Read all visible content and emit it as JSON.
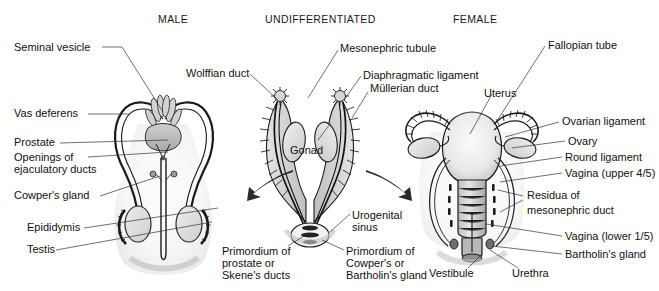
{
  "figure": {
    "background_color": "#ffffff",
    "ink_color": "#111111",
    "leader_color": "#333333",
    "width": 659,
    "height": 291
  },
  "headers": [
    {
      "id": "male",
      "text": "MALE"
    },
    {
      "id": "undifferentiated",
      "text": "UNDIFFERENTIATED"
    },
    {
      "id": "female",
      "text": "FEMALE"
    }
  ],
  "panels": {
    "male": {
      "header": "MALE",
      "labels": [
        {
          "id": "seminal-vesicle",
          "text": "Seminal vesicle"
        },
        {
          "id": "vas-deferens",
          "text": "Vas deferens"
        },
        {
          "id": "prostate",
          "text": "Prostate"
        },
        {
          "id": "openings-ejaculatory-ducts-l1",
          "text": "Openings of"
        },
        {
          "id": "openings-ejaculatory-ducts-l2",
          "text": "ejaculatory ducts"
        },
        {
          "id": "cowpers-gland",
          "text": "Cowper's gland"
        },
        {
          "id": "epididymis",
          "text": "Epididymis"
        },
        {
          "id": "testis",
          "text": "Testis"
        }
      ]
    },
    "undifferentiated": {
      "header": "UNDIFFERENTIATED",
      "labels": [
        {
          "id": "wolffian-duct",
          "text": "Wolffian duct"
        },
        {
          "id": "mesonephric-tubule",
          "text": "Mesonephric tubule"
        },
        {
          "id": "diaphragmatic-ligament",
          "text": "Diaphragmatic ligament"
        },
        {
          "id": "mullerian-duct",
          "text": "Müllerian duct"
        },
        {
          "id": "gonad",
          "text": "Gonad"
        },
        {
          "id": "urogenital-sinus-l1",
          "text": "Urogenital"
        },
        {
          "id": "urogenital-sinus-l2",
          "text": "sinus"
        },
        {
          "id": "primordium-prostate-l1",
          "text": "Primordium of"
        },
        {
          "id": "primordium-prostate-l2",
          "text": "prostate or"
        },
        {
          "id": "primordium-prostate-l3",
          "text": "Skene's ducts"
        },
        {
          "id": "primordium-cowpers-l1",
          "text": "Primordium of"
        },
        {
          "id": "primordium-cowpers-l2",
          "text": "Cowper's or"
        },
        {
          "id": "primordium-cowpers-l3",
          "text": "Bartholin's gland"
        }
      ]
    },
    "female": {
      "header": "FEMALE",
      "labels": [
        {
          "id": "fallopian-tube",
          "text": "Fallopian tube"
        },
        {
          "id": "uterus",
          "text": "Uterus"
        },
        {
          "id": "ovarian-ligament",
          "text": "Ovarian ligament"
        },
        {
          "id": "ovary",
          "text": "Ovary"
        },
        {
          "id": "round-ligament",
          "text": "Round ligament"
        },
        {
          "id": "vagina-upper",
          "text": "Vagina (upper 4/5)"
        },
        {
          "id": "residua-mesonephric-l1",
          "text": "Residua of"
        },
        {
          "id": "residua-mesonephric-l2",
          "text": "mesonephric duct"
        },
        {
          "id": "vagina-lower",
          "text": "Vagina (lower 1/5)"
        },
        {
          "id": "bartholins-gland",
          "text": "Bartholin's gland"
        },
        {
          "id": "vestibule",
          "text": "Vestibule"
        },
        {
          "id": "urethra",
          "text": "Urethra"
        }
      ]
    }
  }
}
